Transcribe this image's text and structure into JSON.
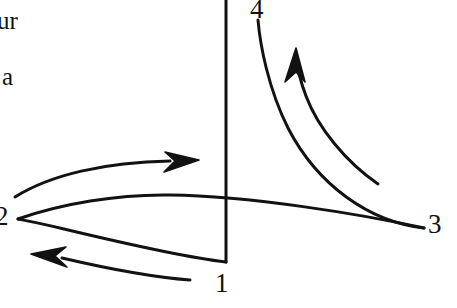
{
  "figure": {
    "width": 457,
    "height": 308,
    "background_color": "#ffffff",
    "ink_color": "#121212",
    "stroke_width": 3
  },
  "text_fragments": [
    {
      "id": "frag-ur",
      "text": "ur",
      "note": "cut off at left page edge"
    },
    {
      "id": "frag-a",
      "text": "a",
      "note": "cut off at left page edge"
    }
  ],
  "state_labels": [
    {
      "id": "lbl-1",
      "text": "1",
      "x": 224,
      "y": 284
    },
    {
      "id": "lbl-2",
      "text": "2",
      "x": 4,
      "y": 219
    },
    {
      "id": "lbl-3",
      "text": "3",
      "x": 436,
      "y": 226
    },
    {
      "id": "lbl-4",
      "text": "4",
      "x": 259,
      "y": 10
    }
  ],
  "axis": {
    "name": "vertical-axis-line",
    "x": 226,
    "y_top": 0,
    "y_bottom": 262
  },
  "curves": [
    {
      "id": "curve-1-2",
      "name": "process-curve-1-to-2",
      "from": "1",
      "to": "2",
      "path": "M 226 262 C 190 258 110 240 64 229 C 44 224 28 221 18 219",
      "direction": "leftward"
    },
    {
      "id": "curve-2-3",
      "name": "process-curve-2-to-3",
      "from": "2",
      "to": "3",
      "path": "M 18 219 C 60 204 118 194 170 195 C 250 196 360 214 424 228",
      "direction": "rightward"
    },
    {
      "id": "curve-2-up",
      "name": "process-curve-2-upper-arrowed",
      "from": "2",
      "to": "arrow-right",
      "path": "M 15 197 C 50 175 105 162 170 161",
      "direction": "rightward",
      "arrowhead": "arrow-right"
    },
    {
      "id": "curve-3-4",
      "name": "process-curve-3-to-4",
      "from": "3",
      "to": "4",
      "path": "M 424 228 C 370 222 318 186 288 128 C 268 88 260 44 258 20",
      "direction": "upward"
    },
    {
      "id": "curve-4-arrowed",
      "name": "process-curve-4-arrowed",
      "from": "lower-right",
      "to": "arrow-up",
      "path": "M 378 184 C 346 162 318 128 306 96 C 300 80 297 66 296 57",
      "direction": "upward",
      "arrowhead": "arrow-up"
    },
    {
      "id": "curve-1-back",
      "name": "process-curve-1-return-arrowed",
      "from": "1",
      "to": "arrow-left",
      "path": "M 190 280 C 150 277 105 268 62 258",
      "direction": "leftward",
      "arrowhead": "arrow-left"
    }
  ],
  "arrowheads": [
    {
      "id": "arrow-right",
      "name": "arrowhead-right",
      "tip_x": 199,
      "tip_y": 160,
      "points_to": "right"
    },
    {
      "id": "arrow-left",
      "name": "arrowhead-left",
      "tip_x": 31,
      "tip_y": 254,
      "points_to": "left"
    },
    {
      "id": "arrow-up",
      "name": "arrowhead-up",
      "tip_x": 296,
      "tip_y": 48,
      "points_to": "up"
    }
  ]
}
